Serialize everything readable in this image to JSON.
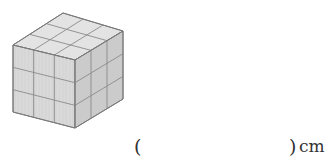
{
  "figure": {
    "type": "cube made of unit cubes",
    "grid": {
      "rows": 3,
      "cols": 3,
      "layers": 3
    },
    "colors": {
      "top_face": "#e3e3e3",
      "front_face": "#d6d6d6",
      "right_face": "#cbcbcb",
      "grid_line": "#8a8a8a",
      "edge_line": "#7a7a7a"
    },
    "vertices": {
      "top_back": [
        63,
        13
      ],
      "top_left": [
        13,
        45
      ],
      "top_front": [
        75,
        60
      ],
      "top_right": [
        123,
        31
      ],
      "bottom_left": [
        13,
        112
      ],
      "bottom_front": [
        75,
        128
      ],
      "bottom_right": [
        123,
        99
      ]
    }
  },
  "answer": {
    "open_paren": "(",
    "value": "",
    "close_paren": ")",
    "unit": "cm"
  }
}
